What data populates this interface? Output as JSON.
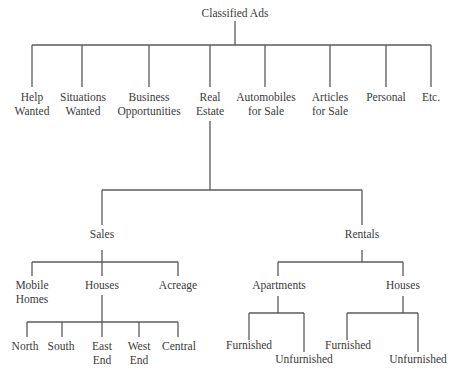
{
  "diagram": {
    "type": "tree",
    "title": "Classified Ads",
    "line_color": "#5a5a5a",
    "text_color": "#3a3a3a",
    "root": {
      "label": "Classified Ads",
      "children": [
        {
          "lines": [
            "Help",
            "Wanted"
          ]
        },
        {
          "lines": [
            "Situations",
            "Wanted"
          ]
        },
        {
          "lines": [
            "Business",
            "Opportunities"
          ]
        },
        {
          "lines": [
            "Real",
            "Estate"
          ]
        },
        {
          "lines": [
            "Automobiles",
            "for Sale"
          ]
        },
        {
          "lines": [
            "Articles",
            "for Sale"
          ]
        },
        {
          "lines": [
            "Personal"
          ]
        },
        {
          "lines": [
            "Etc."
          ]
        }
      ]
    },
    "real_estate": {
      "sales": {
        "label": "Sales",
        "children": [
          {
            "lines": [
              "Mobile",
              "Homes"
            ]
          },
          {
            "lines": [
              "Houses"
            ]
          },
          {
            "lines": [
              "Acreage"
            ]
          }
        ],
        "houses_children": [
          {
            "lines": [
              "North"
            ]
          },
          {
            "lines": [
              "South"
            ]
          },
          {
            "lines": [
              "East",
              "End"
            ]
          },
          {
            "lines": [
              "West",
              "End"
            ]
          },
          {
            "lines": [
              "Central"
            ]
          }
        ]
      },
      "rentals": {
        "label": "Rentals",
        "apartments": {
          "label": "Apartments",
          "children": [
            {
              "lines": [
                "Furnished"
              ]
            },
            {
              "lines": [
                "Unfurnished"
              ]
            }
          ]
        },
        "houses": {
          "label": "Houses",
          "children": [
            {
              "lines": [
                "Furnished"
              ]
            },
            {
              "lines": [
                "Unfurnished"
              ]
            }
          ]
        }
      }
    }
  }
}
